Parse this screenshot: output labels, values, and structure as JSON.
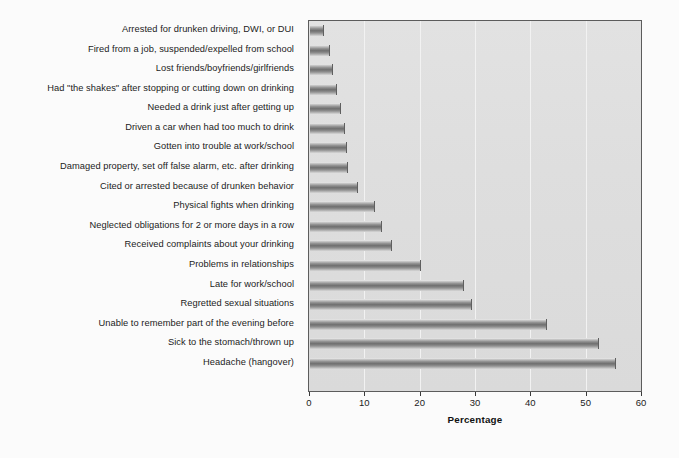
{
  "chart_data": {
    "type": "bar",
    "orientation": "horizontal",
    "title": "",
    "xlabel": "Percentage",
    "ylabel": "",
    "xlim": [
      0,
      60
    ],
    "xticks": [
      0,
      10,
      20,
      30,
      40,
      50,
      60
    ],
    "xtick_labels": [
      "0",
      "10",
      "20",
      "30",
      "40",
      "50",
      "60"
    ],
    "grid": true,
    "grid_axis": "x",
    "legend": false,
    "categories": [
      "Arrested for drunken driving, DWI, or DUI",
      "Fired from a job, suspended/expelled from school",
      "Lost friends/boyfriends/girlfriends",
      "Had \"the shakes\" after stopping or cutting down on drinking",
      "Needed a drink just after getting up",
      "Driven a car when had too much to drink",
      "Gotten into trouble at work/school",
      "Damaged property, set off false alarm, etc. after drinking",
      "Cited or arrested because of drunken behavior",
      "Physical fights when drinking",
      "Neglected obligations for 2 or more days in a row",
      "Received complaints about your drinking",
      "Problems in relationships",
      "Late for work/school",
      "Regretted sexual situations",
      "Unable to remember part of the evening before",
      "Sick to the stomach/thrown up",
      "Headache (hangover)"
    ],
    "values": [
      2.6,
      3.7,
      4.2,
      4.8,
      5.6,
      6.3,
      6.6,
      6.8,
      8.7,
      11.8,
      13.0,
      14.8,
      20.0,
      27.8,
      29.2,
      42.8,
      52.2,
      55.3
    ]
  },
  "colors": {
    "plot_background": "#dedede",
    "bar_dark": "#6f6f6f",
    "bar_light": "#efefef",
    "gridline": "#f2f2f2",
    "frame": "#5c5c5c",
    "text": "#1b1b1b",
    "canvas": "#fbfbfb"
  }
}
